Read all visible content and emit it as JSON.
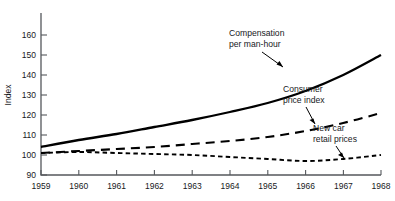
{
  "chart_data": {
    "type": "line",
    "title": "",
    "xlabel": "",
    "ylabel": "Index",
    "xlim": [
      1959,
      1968
    ],
    "ylim": [
      90,
      160
    ],
    "grid": false,
    "legend": "annotations-inline",
    "x": [
      1959,
      1960,
      1961,
      1962,
      1963,
      1964,
      1965,
      1966,
      1967,
      1968
    ],
    "xticklabels": [
      "1959",
      "1960",
      "1961",
      "1962",
      "1963",
      "1964",
      "1965",
      "1966",
      "1967",
      "1968"
    ],
    "yticklabels": [
      "90",
      "100",
      "110",
      "120",
      "130",
      "140",
      "150",
      "160"
    ],
    "yticks": [
      90,
      100,
      110,
      120,
      130,
      140,
      150,
      160
    ],
    "series": [
      {
        "name": "Compensation per man-hour",
        "style": "solid",
        "values": [
          104.0,
          107.5,
          110.5,
          114.0,
          117.5,
          121.5,
          126.0,
          132.0,
          140.0,
          150.0
        ]
      },
      {
        "name": "Consumer price index",
        "style": "long-dash",
        "values": [
          101.0,
          102.0,
          103.0,
          104.0,
          105.5,
          107.0,
          109.0,
          112.0,
          116.0,
          121.0
        ]
      },
      {
        "name": "New car retail prices",
        "style": "short-dash",
        "values": [
          101.0,
          101.5,
          101.0,
          100.5,
          100.0,
          99.0,
          98.0,
          97.0,
          98.0,
          100.0
        ]
      }
    ],
    "annotations": [
      {
        "id": "compensation",
        "line1": "Compensation",
        "line2": "per man-hour"
      },
      {
        "id": "cpi",
        "line1": "Consumer",
        "line2": "price index"
      },
      {
        "id": "newcar",
        "line1": "New car",
        "line2": "retail prices"
      }
    ]
  }
}
